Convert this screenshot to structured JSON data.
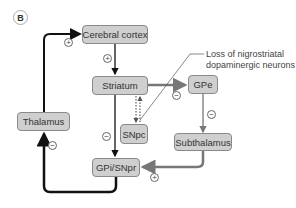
{
  "panel_label": "B",
  "nodes": {
    "cerebral_cortex": "Cerebral cortex",
    "striatum": "Striatum",
    "gpe": "GPe",
    "snpc": "SNpc",
    "thalamus": "Thalamus",
    "gpi_snpr": "GPi/SNpr",
    "subthalamus": "Subthalamus"
  },
  "annotation": {
    "line1": "Loss of nigrostriatal",
    "line2": "dopaminergic neurons"
  },
  "signs": {
    "thalamus_to_cortex": "+",
    "cortex_to_striatum": "+",
    "striatum_to_gpe": "−",
    "striatum_to_gpi": "−",
    "gpe_to_subthalamus": "−",
    "subthalamus_to_gpi": "+",
    "gpi_to_thalamus": "−"
  },
  "colors": {
    "box_fill": "#cfcfcf",
    "box_border": "#8a8a8a",
    "direct_path": "#111111",
    "indirect_path": "#777777"
  }
}
